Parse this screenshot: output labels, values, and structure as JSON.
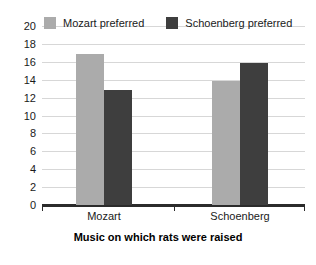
{
  "chart_data": {
    "type": "bar",
    "title": "",
    "xlabel": "Music on which rats were raised",
    "ylabel": "",
    "categories": [
      "Mozart",
      "Schoenberg"
    ],
    "series": [
      {
        "name": "Mozart preferred",
        "color": "#ababab",
        "values": [
          17,
          14
        ]
      },
      {
        "name": "Schoenberg preferred",
        "color": "#3e3e3e",
        "values": [
          13,
          16
        ]
      }
    ],
    "ylim": [
      0,
      20
    ],
    "ytick_step": 2,
    "yticks": [
      20,
      18,
      16,
      14,
      12,
      10,
      8,
      6,
      4,
      2,
      0
    ],
    "grid": true,
    "legend_position": "top-left-inside"
  },
  "legend": {
    "entries": [
      {
        "label": "Mozart preferred",
        "swatch_color": "#ababab"
      },
      {
        "label": "Schoenberg preferred",
        "swatch_color": "#3e3e3e"
      }
    ]
  },
  "axes": {
    "x_title": "Music on which rats were raised",
    "x_categories": [
      "Mozart",
      "Schoenberg"
    ],
    "y_tick_labels": [
      "20",
      "18",
      "16",
      "14",
      "12",
      "10",
      "8",
      "6",
      "4",
      "2",
      "0"
    ]
  },
  "colors": {
    "background": "#ffffff",
    "grid": "#d7d7d7",
    "axis": "#2b2b2b",
    "text": "#1a1a1a",
    "series_light": "#ababab",
    "series_dark": "#3e3e3e"
  }
}
